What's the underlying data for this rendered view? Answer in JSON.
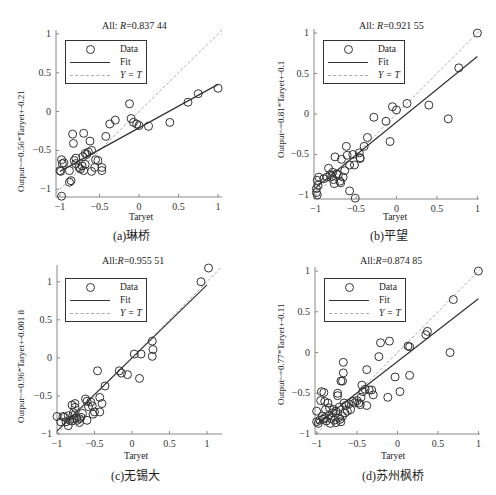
{
  "chart_data": [
    {
      "id": "a",
      "type": "scatter",
      "caption": "(a)琳桥",
      "title_prefix": "All: ",
      "title_R": "R",
      "title_value": "=0.837 44",
      "xlabel": "Taryet",
      "ylabel": "Output~=0.56*Taryet+-0.21",
      "xlim": [
        -1.05,
        1.05
      ],
      "ylim": [
        -1.1,
        1.05
      ],
      "xticks": [
        -1,
        -0.5,
        0,
        0.5,
        1
      ],
      "yticks": [
        -1,
        -0.5,
        0,
        0.5,
        1
      ],
      "legend": [
        "Data",
        "Fit",
        "Y = T"
      ],
      "fit": {
        "slope": 0.56,
        "intercept": -0.21
      },
      "points": [
        [
          -0.98,
          -0.62
        ],
        [
          -0.97,
          -0.67
        ],
        [
          -0.95,
          -0.66
        ],
        [
          -0.99,
          -0.77
        ],
        [
          -1.0,
          -0.76
        ],
        [
          -0.98,
          -1.09
        ],
        [
          -0.88,
          -0.91
        ],
        [
          -0.86,
          -0.89
        ],
        [
          -0.88,
          -0.76
        ],
        [
          -0.84,
          -0.29
        ],
        [
          -0.83,
          -0.41
        ],
        [
          -0.82,
          -0.63
        ],
        [
          -0.8,
          -0.6
        ],
        [
          -0.8,
          -0.67
        ],
        [
          -0.76,
          -0.72
        ],
        [
          -0.74,
          -0.74
        ],
        [
          -0.72,
          -0.7
        ],
        [
          -0.71,
          -0.58
        ],
        [
          -0.7,
          -0.76
        ],
        [
          -0.68,
          -0.54
        ],
        [
          -0.68,
          -0.68
        ],
        [
          -0.66,
          -0.55
        ],
        [
          -0.64,
          -0.52
        ],
        [
          -0.62,
          -0.38
        ],
        [
          -0.6,
          -0.77
        ],
        [
          -0.6,
          -0.5
        ],
        [
          -0.7,
          -0.28
        ],
        [
          -0.55,
          -0.62
        ],
        [
          -0.56,
          -0.72
        ],
        [
          -0.52,
          -0.63
        ],
        [
          -0.47,
          -0.72
        ],
        [
          -0.47,
          -0.76
        ],
        [
          -0.42,
          -0.32
        ],
        [
          -0.37,
          -0.16
        ],
        [
          -0.3,
          -0.11
        ],
        [
          -0.12,
          0.1
        ],
        [
          -0.1,
          -0.09
        ],
        [
          -0.07,
          -0.14
        ],
        [
          -0.03,
          -0.16
        ],
        [
          0.0,
          -0.18
        ],
        [
          0.12,
          -0.19
        ],
        [
          0.39,
          -0.14
        ],
        [
          0.62,
          0.12
        ],
        [
          0.75,
          0.23
        ],
        [
          1.0,
          0.3
        ]
      ]
    },
    {
      "id": "b",
      "type": "scatter",
      "caption": "(b)平望",
      "title_prefix": "All: ",
      "title_R": "R",
      "title_value": "=0.921 55",
      "xlabel": "Taryet",
      "ylabel": "Output~=0.81*Taryet+-0.1",
      "xlim": [
        -1.02,
        1.02
      ],
      "ylim": [
        -1.05,
        1.05
      ],
      "xticks": [
        -1,
        -0.5,
        0,
        0.5,
        1
      ],
      "yticks": [
        -1,
        -0.5,
        0,
        0.5,
        1
      ],
      "legend": [
        "Data",
        "Fit",
        "Y = T"
      ],
      "fit": {
        "slope": 0.81,
        "intercept": -0.1
      },
      "points": [
        [
          -0.98,
          -0.82
        ],
        [
          -0.97,
          -0.88
        ],
        [
          -0.99,
          -0.92
        ],
        [
          -0.99,
          -0.97
        ],
        [
          -0.98,
          -1.0
        ],
        [
          -0.96,
          -0.78
        ],
        [
          -0.9,
          -0.8
        ],
        [
          -0.86,
          -0.78
        ],
        [
          -0.84,
          -0.67
        ],
        [
          -0.82,
          -0.75
        ],
        [
          -0.8,
          -0.77
        ],
        [
          -0.79,
          -0.72
        ],
        [
          -0.78,
          -0.81
        ],
        [
          -0.77,
          -0.86
        ],
        [
          -0.76,
          -0.53
        ],
        [
          -0.74,
          -0.74
        ],
        [
          -0.72,
          -0.75
        ],
        [
          -0.7,
          -0.83
        ],
        [
          -0.69,
          -0.85
        ],
        [
          -0.68,
          -0.56
        ],
        [
          -0.66,
          -0.78
        ],
        [
          -0.64,
          -0.7
        ],
        [
          -0.62,
          -0.4
        ],
        [
          -0.61,
          -0.51
        ],
        [
          -0.58,
          -0.95
        ],
        [
          -0.58,
          -0.63
        ],
        [
          -0.54,
          -0.5
        ],
        [
          -0.52,
          -0.63
        ],
        [
          -0.51,
          -1.04
        ],
        [
          -0.46,
          -0.48
        ],
        [
          -0.45,
          -0.55
        ],
        [
          -0.45,
          -0.54
        ],
        [
          -0.4,
          -0.4
        ],
        [
          -0.36,
          -0.29
        ],
        [
          -0.28,
          -0.04
        ],
        [
          -0.13,
          -0.09
        ],
        [
          -0.08,
          -0.34
        ],
        [
          -0.05,
          0.09
        ],
        [
          0.0,
          0.05
        ],
        [
          0.13,
          0.13
        ],
        [
          0.4,
          0.11
        ],
        [
          0.64,
          -0.06
        ],
        [
          0.77,
          0.57
        ],
        [
          1.0,
          1.0
        ]
      ]
    },
    {
      "id": "c",
      "type": "scatter",
      "caption": "(c)无锡大",
      "title_prefix": "All:",
      "title_R": "R",
      "title_value": "=0.955 51",
      "xlabel": "Taryet",
      "ylabel": "Output~=0.96*Taryet+-0.001 8",
      "xlim": [
        -1.0,
        1.2
      ],
      "ylim": [
        -1.0,
        1.22
      ],
      "xticks": [
        -1,
        -0.5,
        0,
        0.5,
        1
      ],
      "yticks": [
        -1,
        -0.5,
        0,
        0.5,
        1
      ],
      "legend": [
        "Data",
        "Fit",
        "Y = T"
      ],
      "fit": {
        "slope": 0.96,
        "intercept": -0.0018
      },
      "points": [
        [
          -1.0,
          -0.77
        ],
        [
          -0.95,
          -0.84
        ],
        [
          -0.92,
          -0.77
        ],
        [
          -0.9,
          -0.78
        ],
        [
          -0.88,
          -0.84
        ],
        [
          -0.85,
          -0.89
        ],
        [
          -0.85,
          -0.76
        ],
        [
          -0.83,
          -0.82
        ],
        [
          -0.8,
          -0.83
        ],
        [
          -0.8,
          -0.62
        ],
        [
          -0.79,
          -0.76
        ],
        [
          -0.78,
          -0.72
        ],
        [
          -0.77,
          -0.8
        ],
        [
          -0.76,
          -0.6
        ],
        [
          -0.76,
          -0.65
        ],
        [
          -0.74,
          -0.79
        ],
        [
          -0.73,
          -0.82
        ],
        [
          -0.7,
          -0.8
        ],
        [
          -0.7,
          -0.85
        ],
        [
          -0.68,
          -0.78
        ],
        [
          -0.66,
          -0.73
        ],
        [
          -0.62,
          -0.54
        ],
        [
          -0.6,
          -0.57
        ],
        [
          -0.6,
          -0.82
        ],
        [
          -0.58,
          -0.64
        ],
        [
          -0.55,
          -0.58
        ],
        [
          -0.53,
          -0.63
        ],
        [
          -0.52,
          -0.74
        ],
        [
          -0.5,
          -0.71
        ],
        [
          -0.46,
          -0.17
        ],
        [
          -0.43,
          -0.71
        ],
        [
          -0.43,
          -0.52
        ],
        [
          -0.4,
          -0.6
        ],
        [
          -0.36,
          -0.37
        ],
        [
          -0.17,
          -0.17
        ],
        [
          -0.14,
          -0.2
        ],
        [
          -0.06,
          -0.22
        ],
        [
          0.03,
          0.05
        ],
        [
          0.1,
          -0.27
        ],
        [
          0.12,
          0.05
        ],
        [
          0.27,
          0.02
        ],
        [
          0.28,
          0.11
        ],
        [
          0.27,
          0.22
        ],
        [
          0.92,
          1.0
        ],
        [
          1.02,
          1.18
        ]
      ]
    },
    {
      "id": "d",
      "type": "scatter",
      "caption": "(d)苏州枫桥",
      "title_prefix": "All:",
      "title_R": "R",
      "title_value": "=0.874 85",
      "xlabel": "Taryet",
      "ylabel": "Output~=0.77*Taryet+-0.11",
      "xlim": [
        -1.02,
        1.02
      ],
      "ylim": [
        -1.0,
        1.05
      ],
      "xticks": [
        -1,
        -0.5,
        0,
        0.5,
        1
      ],
      "yticks": [
        -1,
        -0.5,
        0,
        0.5,
        1
      ],
      "legend": [
        "Data",
        "Fit",
        "Y = T"
      ],
      "fit": {
        "slope": 0.77,
        "intercept": -0.11
      },
      "points": [
        [
          -1.0,
          -0.72
        ],
        [
          -1.0,
          -0.85
        ],
        [
          -0.98,
          -0.87
        ],
        [
          -0.96,
          -0.83
        ],
        [
          -0.95,
          -0.59
        ],
        [
          -0.94,
          -0.48
        ],
        [
          -0.93,
          -0.78
        ],
        [
          -0.92,
          -0.82
        ],
        [
          -0.91,
          -0.49
        ],
        [
          -0.9,
          -0.6
        ],
        [
          -0.9,
          -0.8
        ],
        [
          -0.89,
          -0.7
        ],
        [
          -0.88,
          -0.84
        ],
        [
          -0.86,
          -0.62
        ],
        [
          -0.85,
          -0.77
        ],
        [
          -0.84,
          -0.68
        ],
        [
          -0.83,
          -0.87
        ],
        [
          -0.82,
          -0.81
        ],
        [
          -0.8,
          -0.74
        ],
        [
          -0.79,
          -0.7
        ],
        [
          -0.78,
          -0.83
        ],
        [
          -0.76,
          -0.72
        ],
        [
          -0.76,
          -0.86
        ],
        [
          -0.74,
          -0.5
        ],
        [
          -0.74,
          -0.53
        ],
        [
          -0.73,
          -0.8
        ],
        [
          -0.72,
          -0.67
        ],
        [
          -0.71,
          -0.82
        ],
        [
          -0.7,
          -0.85
        ],
        [
          -0.7,
          -0.35
        ],
        [
          -0.68,
          -0.78
        ],
        [
          -0.68,
          -0.35
        ],
        [
          -0.67,
          -0.25
        ],
        [
          -0.67,
          -0.12
        ],
        [
          -0.66,
          -0.62
        ],
        [
          -0.65,
          -0.74
        ],
        [
          -0.64,
          -0.65
        ],
        [
          -0.62,
          -0.72
        ],
        [
          -0.6,
          -0.63
        ],
        [
          -0.58,
          -0.7
        ],
        [
          -0.55,
          -0.6
        ],
        [
          -0.53,
          -0.62
        ],
        [
          -0.5,
          -0.59
        ],
        [
          -0.48,
          -0.62
        ],
        [
          -0.46,
          -0.64
        ],
        [
          -0.45,
          -0.55
        ],
        [
          -0.44,
          -0.4
        ],
        [
          -0.43,
          -0.48
        ],
        [
          -0.4,
          -0.45
        ],
        [
          -0.38,
          -0.21
        ],
        [
          -0.38,
          -0.65
        ],
        [
          -0.35,
          -0.46
        ],
        [
          -0.32,
          -0.46
        ],
        [
          -0.3,
          -0.52
        ],
        [
          -0.23,
          -0.05
        ],
        [
          -0.21,
          0.12
        ],
        [
          -0.12,
          -0.55
        ],
        [
          -0.1,
          0.14
        ],
        [
          -0.03,
          -0.3
        ],
        [
          0.03,
          -0.48
        ],
        [
          0.13,
          0.08
        ],
        [
          0.15,
          -0.28
        ],
        [
          0.15,
          0.07
        ],
        [
          0.35,
          0.22
        ],
        [
          0.37,
          0.26
        ],
        [
          0.65,
          0.0
        ],
        [
          0.69,
          0.65
        ],
        [
          1.0,
          1.0
        ]
      ]
    }
  ]
}
